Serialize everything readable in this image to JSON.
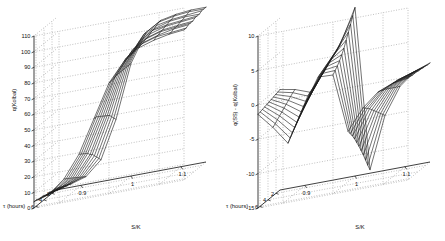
{
  "figure": {
    "background": "#ffffff",
    "line_color": "#1b1b1b",
    "grid_color": "#8d8d8d",
    "panel_count": 2
  },
  "chart_data": [
    {
      "type": "line",
      "plot_kind": "3d-mesh-surface",
      "panel": "left",
      "title": "",
      "xlabel": "S/K",
      "ylabel": "τ (hours)",
      "zlabel": "q(Kolbal)",
      "xticks": [
        "0.9",
        "1",
        "1.1"
      ],
      "xtickvals": [
        0.9,
        1,
        1.1
      ],
      "yticks": [
        "6",
        "4",
        "2"
      ],
      "ytickvals": [
        6,
        4,
        2
      ],
      "zticks": [
        "0",
        "10",
        "20",
        "30",
        "40",
        "50",
        "60",
        "70",
        "80",
        "90",
        "100",
        "110"
      ],
      "ztickvals": [
        0,
        10,
        20,
        30,
        40,
        50,
        60,
        70,
        80,
        90,
        100,
        110
      ],
      "xlim": [
        0.85,
        1.15
      ],
      "ylim": [
        1,
        6.5
      ],
      "zlim": [
        0,
        110
      ],
      "grid": true,
      "legend": "none",
      "x": [
        0.85,
        0.88,
        0.91,
        0.94,
        0.97,
        1.0,
        1.03,
        1.06,
        1.09,
        1.12,
        1.15
      ],
      "y": [
        1.0,
        1.55,
        2.1,
        2.65,
        3.2,
        3.75,
        4.3,
        4.85,
        5.4,
        5.95,
        6.5
      ],
      "z": [
        [
          1,
          2,
          5,
          14,
          38,
          72,
          90,
          96,
          98,
          99,
          99
        ],
        [
          1,
          3,
          6,
          16,
          40,
          72,
          90,
          96,
          98,
          99,
          99
        ],
        [
          1,
          3,
          7,
          18,
          42,
          72,
          89,
          95,
          97,
          98,
          99
        ],
        [
          2,
          4,
          8,
          20,
          44,
          72,
          88,
          94,
          97,
          98,
          98
        ],
        [
          2,
          4,
          9,
          22,
          45,
          72,
          87,
          94,
          96,
          97,
          98
        ],
        [
          2,
          5,
          10,
          23,
          46,
          72,
          86,
          93,
          96,
          97,
          98
        ],
        [
          3,
          5,
          11,
          25,
          47,
          72,
          86,
          92,
          95,
          96,
          97
        ],
        [
          3,
          6,
          12,
          26,
          48,
          72,
          85,
          92,
          95,
          96,
          97
        ],
        [
          3,
          6,
          13,
          27,
          49,
          71,
          84,
          91,
          94,
          96,
          97
        ],
        [
          4,
          7,
          14,
          28,
          50,
          71,
          84,
          91,
          94,
          95,
          96
        ],
        [
          4,
          7,
          15,
          29,
          50,
          71,
          83,
          90,
          93,
          95,
          96
        ]
      ]
    },
    {
      "type": "line",
      "plot_kind": "3d-mesh-surface",
      "panel": "right",
      "title": "",
      "xlabel": "S/K",
      "ylabel": "τ (hours)",
      "zlabel": "q(SS) - q(Kolbal)",
      "xticks": [
        "0.9",
        "1",
        "1.1"
      ],
      "xtickvals": [
        0.9,
        1,
        1.1
      ],
      "yticks": [
        "6",
        "4",
        "2"
      ],
      "ytickvals": [
        6,
        4,
        2
      ],
      "zticks": [
        "-15",
        "-10",
        "-5",
        "0",
        "5",
        "10"
      ],
      "ztickvals": [
        -15,
        -10,
        -5,
        0,
        5,
        10
      ],
      "xlim": [
        0.85,
        1.15
      ],
      "ylim": [
        1,
        6.5
      ],
      "zlim": [
        -15,
        10
      ],
      "grid": true,
      "legend": "none",
      "x": [
        0.85,
        0.88,
        0.91,
        0.94,
        0.97,
        1.0,
        1.03,
        1.06,
        1.09,
        1.12,
        1.15
      ],
      "y": [
        1.0,
        1.55,
        2.1,
        2.65,
        3.2,
        3.75,
        4.3,
        4.85,
        5.4,
        5.95,
        6.5
      ],
      "z": [
        [
          -0.4,
          -0.8,
          -1.6,
          1.2,
          4.4,
          9.5,
          -14.5,
          -7.0,
          -3.2,
          -1.4,
          -0.6
        ],
        [
          -0.5,
          -1.0,
          -1.9,
          1.0,
          4.2,
          8.6,
          -13.6,
          -6.6,
          -3.0,
          -1.3,
          -0.6
        ],
        [
          -0.6,
          -1.3,
          -2.4,
          0.7,
          4.0,
          7.6,
          -12.6,
          -6.2,
          -2.8,
          -1.2,
          -0.5
        ],
        [
          -0.7,
          -1.6,
          -2.9,
          0.4,
          3.8,
          6.7,
          -11.6,
          -5.8,
          -2.6,
          -1.1,
          -0.5
        ],
        [
          -0.8,
          -1.9,
          -3.4,
          0.1,
          3.6,
          5.8,
          -10.7,
          -5.4,
          -2.4,
          -1.0,
          -0.4
        ],
        [
          -0.9,
          -2.2,
          -3.9,
          -0.2,
          3.4,
          4.9,
          -9.8,
          -5.0,
          -2.2,
          -0.9,
          -0.4
        ],
        [
          -1.0,
          -2.5,
          -4.4,
          -0.5,
          3.2,
          4.2,
          -9.0,
          -4.6,
          -2.0,
          -0.8,
          -0.3
        ],
        [
          -1.1,
          -2.8,
          -4.9,
          -0.8,
          3.0,
          3.6,
          -8.2,
          -4.2,
          -1.8,
          -0.7,
          -0.3
        ],
        [
          -1.2,
          -3.1,
          -5.4,
          -1.1,
          2.8,
          3.1,
          -7.5,
          -3.9,
          -1.7,
          -0.6,
          -0.3
        ],
        [
          -1.3,
          -3.4,
          -5.9,
          -1.4,
          2.6,
          2.7,
          -6.9,
          -3.6,
          -1.5,
          -0.6,
          -0.2
        ],
        [
          -1.4,
          -3.7,
          -6.4,
          -1.7,
          2.4,
          2.3,
          -6.3,
          -3.3,
          -1.4,
          -0.5,
          -0.2
        ]
      ]
    }
  ]
}
